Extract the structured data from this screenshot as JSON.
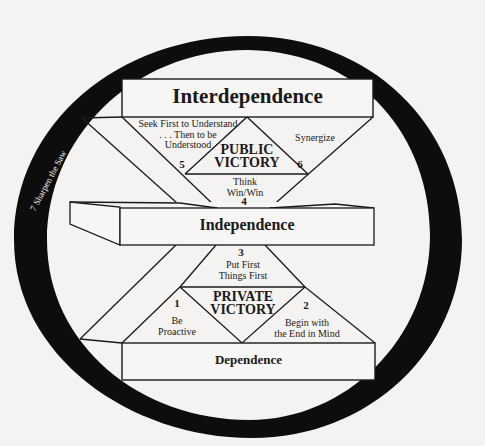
{
  "diagram": {
    "ring": {
      "label": "7  Sharpen the Saw",
      "color": "#0d0d0d"
    },
    "levels": {
      "interdependence": "Interdependence",
      "independence": "Independence",
      "dependence": "Dependence"
    },
    "victories": {
      "public": [
        "PUBLIC",
        "VICTORY"
      ],
      "private": [
        "PRIVATE",
        "VICTORY"
      ]
    },
    "habits": [
      {
        "number": "1",
        "lines": [
          "Be",
          "Proactive"
        ]
      },
      {
        "number": "2",
        "lines": [
          "Begin with",
          "the End in Mind"
        ]
      },
      {
        "number": "3",
        "lines": [
          "Put First",
          "Things First"
        ]
      },
      {
        "number": "4",
        "lines": [
          "Think",
          "Win/Win"
        ]
      },
      {
        "number": "5",
        "lines": [
          "Seek First to Understand",
          ". . . Then to be",
          "Understood"
        ]
      },
      {
        "number": "6",
        "lines": [
          "Synergize"
        ]
      }
    ],
    "colors": {
      "background": "#f4f3f1",
      "ink": "#1a1a1a",
      "box_fill": "#f7f6f4"
    }
  }
}
